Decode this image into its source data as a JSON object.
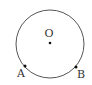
{
  "diagram": {
    "circle": {
      "cx": 50,
      "cy": 44,
      "r": 34,
      "stroke": "#555555"
    },
    "points": [
      {
        "name": "O",
        "label": "O",
        "x": 50,
        "y": 43,
        "lx": 49,
        "ly": 37
      },
      {
        "name": "A",
        "label": "A",
        "x": 25,
        "y": 66,
        "lx": 21,
        "ly": 77
      },
      {
        "name": "B",
        "label": "B",
        "x": 76,
        "y": 67,
        "lx": 81,
        "ly": 78
      }
    ]
  }
}
